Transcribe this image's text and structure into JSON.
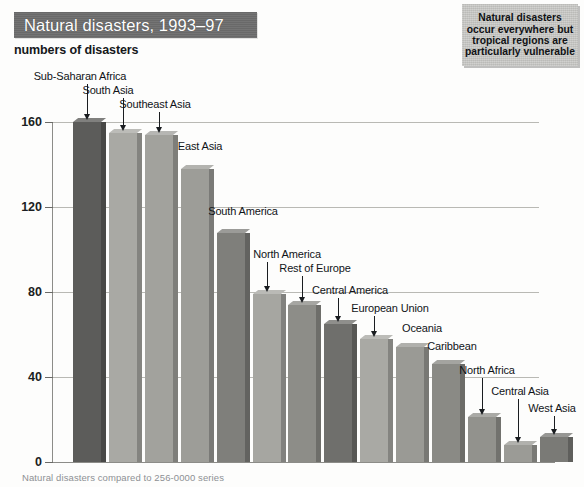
{
  "header": {
    "title": "Natural disasters, 1993–97",
    "subtitle": "numbers of disasters",
    "title_bg": "#6d6d6d"
  },
  "caption": {
    "text": "Natural disasters occur everywhere but tropical regions are particularly vulnerable",
    "bg": "#c9c9c6"
  },
  "footer": {
    "note": "Natural disasters compared to 256-0000 series"
  },
  "chart_data": {
    "type": "bar",
    "title": "Natural disasters, 1993–97",
    "subtitle": "numbers of disasters",
    "xlabel": "",
    "ylabel": "numbers of disasters",
    "ylim": [
      0,
      168
    ],
    "yticks": [
      0,
      40,
      80,
      120,
      160
    ],
    "ytick_labels": [
      "0",
      "40",
      "80",
      "120",
      "160"
    ],
    "grid": true,
    "legend": "none",
    "categories": [
      "Sub-Saharan Africa",
      "South Asia",
      "Southeast Asia",
      "East Asia",
      "South America",
      "North America",
      "Rest of Europe",
      "Central America",
      "European Union",
      "Oceania",
      "Caribbean",
      "North Africa",
      "Central Asia",
      "West Asia"
    ],
    "values": [
      160,
      155,
      154,
      138,
      108,
      79,
      74,
      65,
      58,
      54,
      46,
      21,
      8,
      12
    ],
    "bar_colors": [
      "#5c5c5a",
      "#a9a9a4",
      "#a2a29d",
      "#9d9d98",
      "#7f7f7b",
      "#a6a6a1",
      "#8d8d88",
      "#6f6f6c",
      "#a9a9a4",
      "#9a9a95",
      "#8a8a85",
      "#92928d",
      "#9b9b96",
      "#7a7a76"
    ]
  }
}
